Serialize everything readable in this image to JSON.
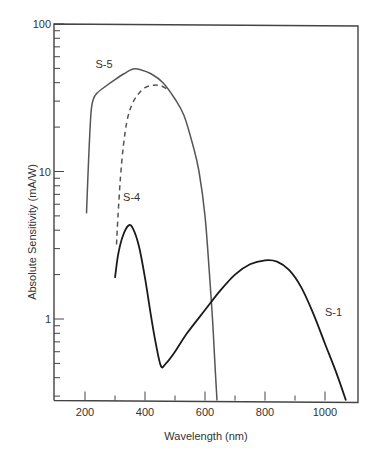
{
  "chart_data": {
    "type": "line",
    "title": "",
    "xlabel": "Wavelength (nm)",
    "ylabel": "Absolute Sensitivity (mA/W)",
    "xlim": [
      100,
      1120
    ],
    "ylim": [
      0.28,
      100
    ],
    "yscale": "log",
    "grid": false,
    "legend": "inline labels",
    "x_ticks": [
      200,
      400,
      600,
      800,
      1000
    ],
    "x_minor_ticks": [
      300,
      500,
      700,
      900
    ],
    "y_ticks": [
      1,
      10,
      100
    ],
    "y_tick_labels": [
      "1",
      "10",
      "100"
    ],
    "series": [
      {
        "name": "S-5",
        "style": "solid",
        "color": "#555555",
        "label_pos": {
          "nm": 235,
          "v": 50
        },
        "points": [
          [
            205,
            5.2
          ],
          [
            212,
            12
          ],
          [
            220,
            25
          ],
          [
            228,
            31
          ],
          [
            240,
            34
          ],
          [
            270,
            38
          ],
          [
            300,
            42
          ],
          [
            330,
            46
          ],
          [
            360,
            49.5
          ],
          [
            385,
            49
          ],
          [
            420,
            46
          ],
          [
            460,
            40
          ],
          [
            500,
            31
          ],
          [
            530,
            24
          ],
          [
            560,
            15
          ],
          [
            580,
            10
          ],
          [
            600,
            5
          ],
          [
            615,
            2
          ],
          [
            625,
            1
          ],
          [
            633,
            0.5
          ],
          [
            640,
            0.28
          ]
        ]
      },
      {
        "name": "S-4",
        "style": "dashed",
        "color": "#555555",
        "label_pos": {
          "nm": 327,
          "v": 6.3
        },
        "points": [
          [
            305,
            3.2
          ],
          [
            310,
            5
          ],
          [
            318,
            9
          ],
          [
            328,
            15
          ],
          [
            340,
            22
          ],
          [
            355,
            28
          ],
          [
            375,
            33
          ],
          [
            400,
            37
          ],
          [
            430,
            38.5
          ],
          [
            455,
            38
          ],
          [
            475,
            36
          ]
        ]
      },
      {
        "name": "S-1",
        "style": "solid",
        "color": "#1a1a1a",
        "label_pos": {
          "nm": 1000,
          "v": 1.05
        },
        "points": [
          [
            300,
            1.9
          ],
          [
            310,
            2.7
          ],
          [
            325,
            3.6
          ],
          [
            345,
            4.3
          ],
          [
            360,
            4.1
          ],
          [
            380,
            3.1
          ],
          [
            400,
            1.9
          ],
          [
            420,
            1.05
          ],
          [
            435,
            0.7
          ],
          [
            453,
            0.48
          ],
          [
            470,
            0.5
          ],
          [
            500,
            0.6
          ],
          [
            540,
            0.8
          ],
          [
            600,
            1.15
          ],
          [
            650,
            1.55
          ],
          [
            700,
            2.0
          ],
          [
            750,
            2.35
          ],
          [
            800,
            2.5
          ],
          [
            840,
            2.45
          ],
          [
            880,
            2.15
          ],
          [
            920,
            1.65
          ],
          [
            960,
            1.1
          ],
          [
            1000,
            0.68
          ],
          [
            1040,
            0.42
          ],
          [
            1070,
            0.28
          ]
        ]
      }
    ]
  }
}
